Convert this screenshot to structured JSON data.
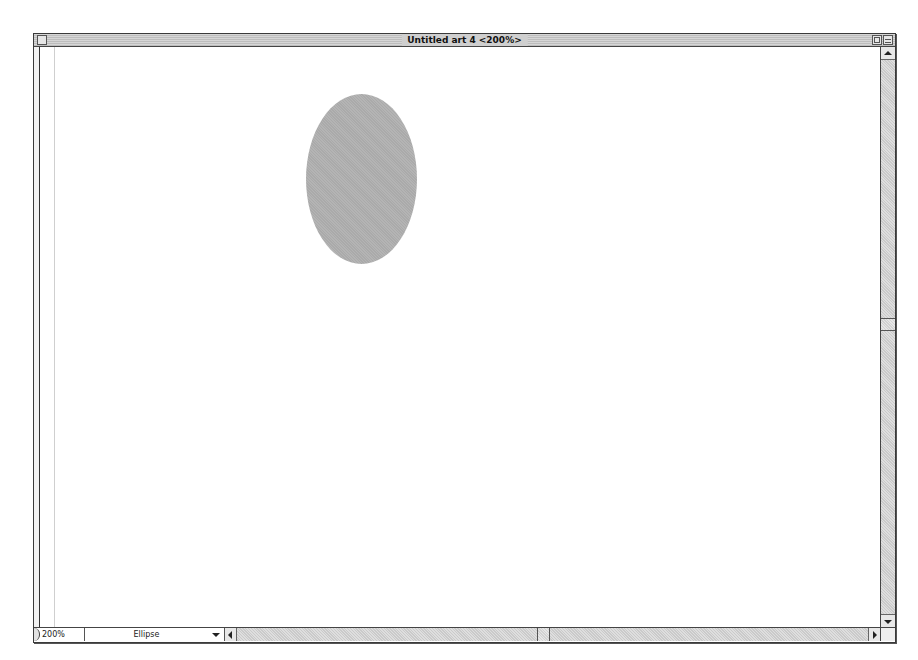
{
  "window": {
    "title": "Untitled art 4 <200%>"
  },
  "canvas": {
    "shapes": [
      {
        "type": "ellipse",
        "fill": "#b0b0b0",
        "left": 266,
        "top": 47,
        "width": 111,
        "height": 170
      }
    ]
  },
  "statusbar": {
    "zoom_level": "200%",
    "current_tool": "Ellipse"
  },
  "colors": {
    "ellipse_fill": "#b0b0b0",
    "chrome_gray": "#d0d0d0"
  }
}
